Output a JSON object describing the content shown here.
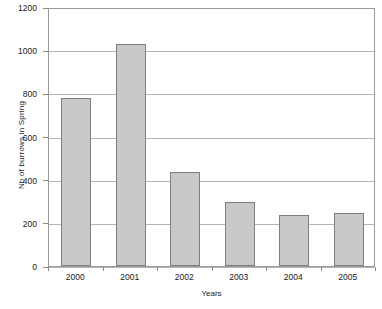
{
  "chart_data": {
    "type": "bar",
    "title": "",
    "categories": [
      "2000",
      "2001",
      "2002",
      "2003",
      "2004",
      "2005"
    ],
    "values": [
      780,
      1030,
      435,
      295,
      237,
      245
    ],
    "xlabel": "Years",
    "ylabel": "Nb of burrows in Spring",
    "ylim": [
      0,
      1200
    ],
    "ytick_values": [
      0,
      200,
      400,
      600,
      800,
      1000,
      1200
    ],
    "ytick_labels": [
      "0",
      "200",
      "400",
      "600",
      "800",
      "1000",
      "1200"
    ],
    "grid": "horizontal",
    "legend": "none",
    "bar_fill_color": "#c9c9c9",
    "bar_border_color": "#7e7e7e",
    "gridline_color": "#b4b4b4",
    "plot_border_color": "#9a9a9a",
    "background_color": "#ffffff"
  }
}
